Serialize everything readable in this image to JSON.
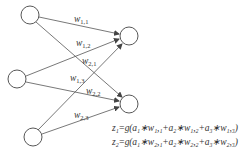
{
  "diagram": {
    "type": "neural-network",
    "input_nodes": [
      {
        "id": "a1",
        "cx": 30,
        "cy": 15
      },
      {
        "id": "a2",
        "cx": 17,
        "cy": 79
      },
      {
        "id": "a3",
        "cx": 33,
        "cy": 137
      }
    ],
    "output_nodes": [
      {
        "id": "z1",
        "cx": 129,
        "cy": 36
      },
      {
        "id": "z2",
        "cx": 129,
        "cy": 104
      }
    ],
    "edges": [
      {
        "from": "a1",
        "to": "z1",
        "label": "w",
        "sub": "1,1"
      },
      {
        "from": "a2",
        "to": "z1",
        "label": "w",
        "sub": "1,2"
      },
      {
        "from": "a1",
        "to": "z2",
        "label": "w",
        "sub": "2,1"
      },
      {
        "from": "a3",
        "to": "z1",
        "label": "w",
        "sub": "1,3"
      },
      {
        "from": "a2",
        "to": "z2",
        "label": "w",
        "sub": "2,2"
      },
      {
        "from": "a3",
        "to": "z2",
        "label": "w",
        "sub": "2,3"
      }
    ],
    "formulas": [
      "z₁=g(a₁∗w₁,₁+a₂∗w₁,₂+a₃∗w₁,₃)",
      "z₂=g(a₁∗w₂,₁+a₂∗w₂,₂+a₃∗w₂,₃)"
    ],
    "colors": {
      "stroke": "#444444",
      "text": "#333333",
      "background": "#ffffff"
    }
  }
}
